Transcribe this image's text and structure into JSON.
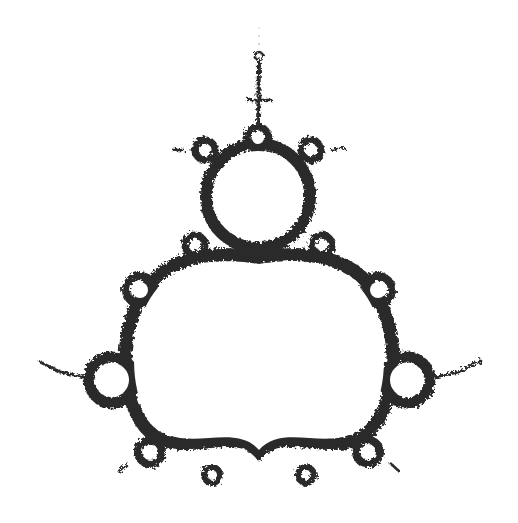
{
  "image": {
    "subject": "Mandelbrot set fractal boundary (rotated, cusp pointing down)",
    "background": "#ffffff",
    "ink": "#2b2b2b",
    "fringe": "#555555"
  },
  "shapes": {
    "cardioid": {
      "cx": 259,
      "cy": 352,
      "rx": 131,
      "ry": 108,
      "cusp": [
        259,
        452
      ]
    },
    "top_bulb": {
      "cx": 258,
      "cy": 196,
      "r": 45
    },
    "left_bulb": {
      "cx": 112,
      "cy": 380,
      "r": 17
    },
    "right_bulb": {
      "cx": 407,
      "cy": 380,
      "r": 17
    },
    "antenna_bulb": {
      "cx": 259,
      "cy": 56,
      "r": 4
    }
  }
}
